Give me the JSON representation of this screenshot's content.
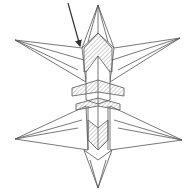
{
  "diagram": {
    "type": "origami-fold-step",
    "colors": {
      "background": "#ffffff",
      "line": "#555555",
      "arrow": "#333333",
      "hatch": "#777777"
    },
    "elements": [
      {
        "name": "fold-arrow",
        "from": [
          68,
          3
        ],
        "to": [
          80,
          46
        ]
      },
      {
        "name": "top-point",
        "tip": [
          98,
          5
        ]
      },
      {
        "name": "upper-left-point",
        "tip": [
          15,
          40
        ]
      },
      {
        "name": "upper-right-point",
        "tip": [
          180,
          38
        ]
      },
      {
        "name": "lower-left-point",
        "tip": [
          15,
          139
        ]
      },
      {
        "name": "lower-right-point",
        "tip": [
          182,
          140
        ]
      },
      {
        "name": "bottom-point",
        "tip": [
          98,
          188
        ]
      }
    ]
  }
}
